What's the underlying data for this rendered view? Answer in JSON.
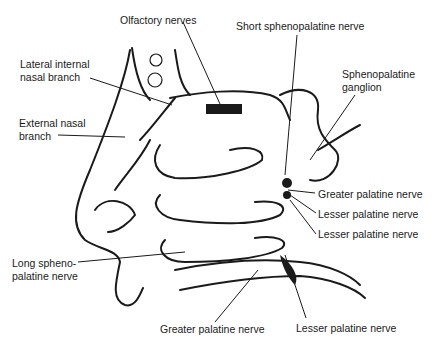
{
  "figure": {
    "colors": {
      "ink": "#1a1a1a",
      "background": "#ffffff"
    }
  },
  "labels": {
    "olfactory_nerves": "Olfactory nerves",
    "short_sphenopalatine_nerve": "Short sphenopalatine nerve",
    "lateral_internal_nasal_branch_1": "Lateral internal",
    "lateral_internal_nasal_branch_2": "nasal branch",
    "sphenopalatine_ganglion_1": "Sphenopalatine",
    "sphenopalatine_ganglion_2": "ganglion",
    "external_nasal_branch_1": "External nasal",
    "external_nasal_branch_2": "branch",
    "greater_palatine_nerve_right": "Greater palatine nerve",
    "lesser_palatine_nerve_right_1": "Lesser palatine nerve",
    "lesser_palatine_nerve_right_2": "Lesser palatine nerve",
    "long_sphenopalatine_nerve_1": "Long spheno-",
    "long_sphenopalatine_nerve_2": "palatine nerve",
    "greater_palatine_nerve_bottom": "Greater palatine nerve",
    "lesser_palatine_nerve_bottom": "Lesser palatine nerve"
  }
}
